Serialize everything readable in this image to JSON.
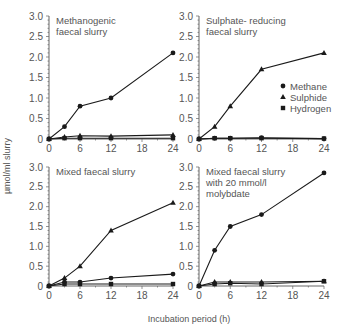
{
  "figure": {
    "ylabel": "µmol/ml slurry",
    "xlabel": "Incubation period (h)",
    "legend": {
      "items": [
        {
          "label": "Methane",
          "marker": "circle"
        },
        {
          "label": "Sulphide",
          "marker": "triangle"
        },
        {
          "label": "Hydrogen",
          "marker": "square"
        }
      ]
    }
  },
  "chart_data": [
    {
      "type": "line",
      "title": "Methanogenic faecal slurry",
      "title_lines": [
        "Methanogenic",
        "faecal slurry"
      ],
      "x": [
        0,
        3,
        6,
        12,
        24
      ],
      "xticks": [
        0,
        6,
        12,
        18,
        24
      ],
      "yticks": [
        0,
        0.5,
        1.0,
        1.5,
        2.0,
        2.5,
        3.0
      ],
      "ytick_labels": [
        "0",
        "0.5",
        "1.0",
        "1.5",
        "2.0",
        "2.5",
        "3.0"
      ],
      "ylim": [
        0,
        3.0
      ],
      "xlim": [
        0,
        24
      ],
      "xlabel": "Incubation period (h)",
      "ylabel": "µmol/ml slurry",
      "series": [
        {
          "name": "Methane",
          "marker": "circle",
          "values": [
            0,
            0.3,
            0.8,
            1.0,
            2.1
          ]
        },
        {
          "name": "Sulphide",
          "marker": "triangle",
          "values": [
            0,
            0.05,
            0.08,
            0.07,
            0.1
          ]
        },
        {
          "name": "Hydrogen",
          "marker": "square",
          "values": [
            0,
            0.02,
            0.02,
            0.02,
            0.02
          ]
        }
      ]
    },
    {
      "type": "line",
      "title": "Sulphate- reducing faecal slurry",
      "title_lines": [
        "Sulphate- reducing",
        "faecal slurry"
      ],
      "x": [
        0,
        3,
        6,
        12,
        24
      ],
      "xticks": [
        0,
        6,
        12,
        18,
        24
      ],
      "yticks": [
        0,
        0.5,
        1.0,
        1.5,
        2.0,
        2.5,
        3.0
      ],
      "ytick_labels": [
        "0",
        "0.5",
        "1.0",
        "1.5",
        "2.0",
        "2.5",
        "3.0"
      ],
      "ylim": [
        0,
        3.0
      ],
      "xlim": [
        0,
        24
      ],
      "xlabel": "Incubation period (h)",
      "ylabel": "µmol/ml slurry",
      "legend": [
        "Methane",
        "Sulphide",
        "Hydrogen"
      ],
      "series": [
        {
          "name": "Methane",
          "marker": "circle",
          "values": [
            0,
            0.02,
            0.02,
            0.03,
            0.01
          ]
        },
        {
          "name": "Sulphide",
          "marker": "triangle",
          "values": [
            0,
            0.3,
            0.8,
            1.7,
            2.1
          ]
        },
        {
          "name": "Hydrogen",
          "marker": "square",
          "values": [
            0,
            0.02,
            0.02,
            0.02,
            0.01
          ]
        }
      ]
    },
    {
      "type": "line",
      "title": "Mixed faecal slurry",
      "title_lines": [
        "Mixed faecal slurry"
      ],
      "x": [
        0,
        3,
        6,
        12,
        24
      ],
      "xticks": [
        0,
        6,
        12,
        18,
        24
      ],
      "yticks": [
        0,
        0.5,
        1.0,
        1.5,
        2.0,
        2.5,
        3.0
      ],
      "ytick_labels": [
        "0",
        "0.5",
        "1.0",
        "1.5",
        "2.0",
        "2.5",
        "3.0"
      ],
      "ylim": [
        0,
        3.0
      ],
      "xlim": [
        0,
        24
      ],
      "xlabel": "Incubation period (h)",
      "ylabel": "µmol/ml slurry",
      "series": [
        {
          "name": "Methane",
          "marker": "circle",
          "values": [
            0,
            0.1,
            0.1,
            0.2,
            0.3
          ]
        },
        {
          "name": "Sulphide",
          "marker": "triangle",
          "values": [
            0,
            0.2,
            0.5,
            1.4,
            2.1
          ]
        },
        {
          "name": "Hydrogen",
          "marker": "square",
          "values": [
            0,
            0.05,
            0.05,
            0.05,
            0.05
          ]
        }
      ]
    },
    {
      "type": "line",
      "title": "Mixed faecal slurry with 20 mmol/l molybdate",
      "title_lines": [
        "Mixed faecal slurry",
        "with 20 mmol/l",
        "molybdate"
      ],
      "x": [
        0,
        3,
        6,
        12,
        24
      ],
      "xticks": [
        0,
        6,
        12,
        18,
        24
      ],
      "yticks": [
        0,
        0.5,
        1.0,
        1.5,
        2.0,
        2.5,
        3.0
      ],
      "ytick_labels": [
        "0",
        "0.5",
        "1.0",
        "1.5",
        "2.0",
        "2.5",
        "3.0"
      ],
      "ylim": [
        0,
        3.0
      ],
      "xlim": [
        0,
        24
      ],
      "xlabel": "Incubation period (h)",
      "ylabel": "µmol/ml slurry",
      "series": [
        {
          "name": "Methane",
          "marker": "circle",
          "values": [
            0,
            0.9,
            1.5,
            1.8,
            2.85
          ]
        },
        {
          "name": "Sulphide",
          "marker": "triangle",
          "values": [
            0,
            0.1,
            0.1,
            0.1,
            0.12
          ]
        },
        {
          "name": "Hydrogen",
          "marker": "square",
          "values": [
            0,
            0.05,
            0.07,
            0.05,
            0.12
          ]
        }
      ]
    }
  ]
}
